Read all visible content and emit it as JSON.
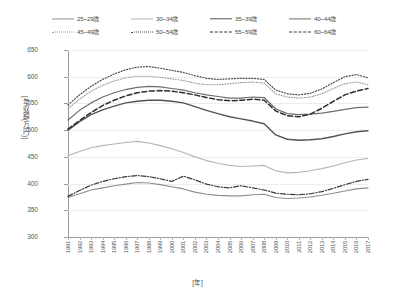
{
  "chart_data": {
    "type": "line",
    "title": "",
    "xlabel": "[年]",
    "ylabel": "[年収額(万円)]",
    "xlim": [
      1991,
      2017
    ],
    "ylim": [
      300,
      650
    ],
    "yticks": [
      300,
      350,
      400,
      450,
      500,
      550,
      600,
      650
    ],
    "grid": true,
    "legend_position": "top",
    "x": [
      1991,
      1992,
      1993,
      1994,
      1995,
      1996,
      1997,
      1998,
      1999,
      2000,
      2001,
      2002,
      2003,
      2004,
      2005,
      2006,
      2007,
      2008,
      2009,
      2010,
      2011,
      2012,
      2013,
      2014,
      2015,
      2016,
      2017
    ],
    "series": [
      {
        "name": "25~29歳",
        "style": "solid",
        "color": "#8e8e8e",
        "width": 1.1,
        "values": [
          374,
          381,
          388,
          392,
          396,
          399,
          402,
          401,
          398,
          394,
          390,
          384,
          380,
          378,
          377,
          377,
          379,
          380,
          374,
          372,
          373,
          375,
          378,
          382,
          386,
          390,
          392
        ]
      },
      {
        "name": "30~34歳",
        "style": "solid",
        "color": "#b5b5b5",
        "width": 1.1,
        "values": [
          452,
          460,
          467,
          471,
          474,
          477,
          479,
          476,
          471,
          465,
          458,
          450,
          443,
          438,
          434,
          432,
          433,
          434,
          424,
          420,
          421,
          424,
          428,
          433,
          439,
          444,
          447
        ]
      },
      {
        "name": "35~39歳",
        "style": "solid",
        "color": "#545454",
        "width": 1.4,
        "values": [
          500,
          516,
          529,
          538,
          545,
          551,
          554,
          556,
          556,
          554,
          551,
          544,
          537,
          531,
          525,
          521,
          517,
          512,
          491,
          483,
          481,
          482,
          484,
          488,
          493,
          497,
          499
        ]
      },
      {
        "name": "40~44歳",
        "style": "solid",
        "color": "#6e6e6e",
        "width": 1.2,
        "values": [
          519,
          537,
          551,
          562,
          570,
          576,
          580,
          582,
          581,
          578,
          575,
          570,
          566,
          563,
          560,
          560,
          562,
          561,
          540,
          531,
          529,
          530,
          532,
          535,
          539,
          542,
          543
        ]
      },
      {
        "name": "45~49歳",
        "style": "dotted",
        "color": "#9a9a9a",
        "width": 1.1,
        "values": [
          540,
          558,
          573,
          584,
          592,
          598,
          601,
          601,
          599,
          596,
          593,
          588,
          585,
          585,
          587,
          589,
          590,
          588,
          568,
          562,
          560,
          562,
          568,
          578,
          587,
          590,
          585
        ]
      },
      {
        "name": "50~54歳",
        "style": "dotted",
        "color": "#4a4a4a",
        "width": 1.2,
        "values": [
          547,
          566,
          582,
          595,
          605,
          613,
          618,
          619,
          616,
          612,
          608,
          602,
          597,
          595,
          596,
          597,
          597,
          595,
          575,
          568,
          566,
          569,
          577,
          589,
          600,
          604,
          598
        ]
      },
      {
        "name": "55~59歳",
        "style": "dashed",
        "color": "#2e2e2e",
        "width": 1.5,
        "values": [
          502,
          518,
          533,
          546,
          556,
          564,
          570,
          573,
          574,
          573,
          570,
          566,
          561,
          557,
          555,
          556,
          558,
          556,
          536,
          527,
          525,
          530,
          541,
          554,
          566,
          573,
          578
        ]
      },
      {
        "name": "60~64歳",
        "style": "dashdot",
        "color": "#3a3a3a",
        "width": 1.2,
        "values": [
          376,
          387,
          397,
          404,
          409,
          413,
          415,
          413,
          409,
          404,
          414,
          407,
          399,
          394,
          392,
          396,
          392,
          388,
          382,
          380,
          379,
          381,
          385,
          391,
          398,
          404,
          408
        ]
      }
    ]
  }
}
